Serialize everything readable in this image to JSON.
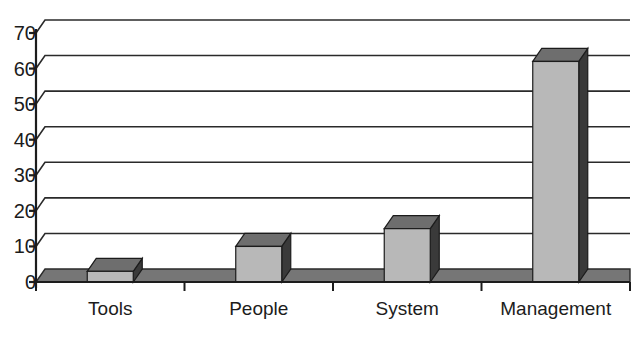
{
  "chart_data": {
    "type": "bar",
    "title": "",
    "subtitle": "",
    "xlabel": "",
    "ylabel": "",
    "categories": [
      "Tools",
      "People",
      "System",
      "Management"
    ],
    "values": [
      3,
      10,
      15,
      62
    ],
    "ylim": [
      0,
      70
    ],
    "yticks": [
      0,
      10,
      20,
      30,
      40,
      50,
      60,
      70
    ],
    "ytick_labels": [
      "0",
      "10",
      "20",
      "30",
      "40",
      "50",
      "60",
      "70"
    ],
    "grid": true,
    "grid_axis": "y",
    "legend": false,
    "legend_position": "none",
    "style": "3d-bar",
    "annotations": [],
    "colors": {
      "bar_front": "#b8b8b8",
      "bar_side": "#3a3a3a",
      "bar_top": "#6e6e6e",
      "floor": "#767676",
      "gridline": "#2a2a2a",
      "axis": "#1c1c1c",
      "text": "#1c1c1c",
      "background": "#ffffff"
    }
  }
}
